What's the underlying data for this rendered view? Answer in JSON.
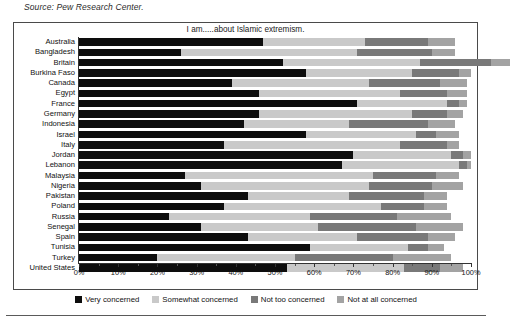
{
  "source_note": "Source: Pew Research Center.",
  "chart_data": {
    "type": "bar",
    "subtype": "stacked-horizontal-100",
    "title": "I am.....about Islamic extremism.",
    "xlabel": "",
    "ylabel": "",
    "xlim": [
      0,
      100
    ],
    "grid": false,
    "legend_position": "bottom",
    "tick_labels": [
      "0%",
      "10%",
      "20%",
      "30%",
      "40%",
      "50%",
      "60%",
      "70%",
      "80%",
      "90%",
      "100%"
    ],
    "tick_values": [
      0,
      10,
      20,
      30,
      40,
      50,
      60,
      70,
      80,
      90,
      100
    ],
    "categories": [
      "Australia",
      "Bangladesh",
      "Britain",
      "Burkina Faso",
      "Canada",
      "Egypt",
      "France",
      "Germany",
      "Indonesia",
      "Israel",
      "Italy",
      "Jordan",
      "Lebanon",
      "Malaysia",
      "Nigeria",
      "Pakistan",
      "Poland",
      "Russia",
      "Senegal",
      "Spain",
      "Tunisia",
      "Turkey",
      "United States"
    ],
    "series": [
      {
        "name": "Very concerned",
        "color": "#0d0d0d",
        "values": [
          47,
          26,
          52,
          58,
          39,
          46,
          71,
          46,
          42,
          58,
          37,
          70,
          67,
          27,
          31,
          43,
          37,
          23,
          31,
          43,
          59,
          20,
          53
        ]
      },
      {
        "name": "Somewhat concerned",
        "color": "#c9c9c9",
        "values": [
          26,
          45,
          35,
          27,
          35,
          36,
          23,
          39,
          27,
          28,
          45,
          25,
          30,
          48,
          43,
          26,
          40,
          36,
          30,
          28,
          25,
          35,
          30
        ]
      },
      {
        "name": "Not too concerned",
        "color": "#797979",
        "values": [
          16,
          19,
          18,
          12,
          18,
          12,
          3,
          9,
          20,
          5,
          12,
          3,
          2,
          16,
          16,
          19,
          11,
          22,
          25,
          18,
          5,
          25,
          9
        ]
      },
      {
        "name": "Not at all concerned",
        "color": "#a3a3a3",
        "values": [
          7,
          6,
          5,
          3,
          7,
          5,
          2,
          4,
          7,
          6,
          3,
          2,
          1,
          6,
          8,
          6,
          6,
          14,
          12,
          7,
          4,
          15,
          6
        ]
      }
    ]
  },
  "legend": {
    "items": [
      {
        "label": "Very concerned",
        "color": "#0d0d0d"
      },
      {
        "label": "Somewhat concerned",
        "color": "#c9c9c9"
      },
      {
        "label": "Not too concerned",
        "color": "#797979"
      },
      {
        "label": "Not at all concerned",
        "color": "#a3a3a3"
      }
    ]
  }
}
